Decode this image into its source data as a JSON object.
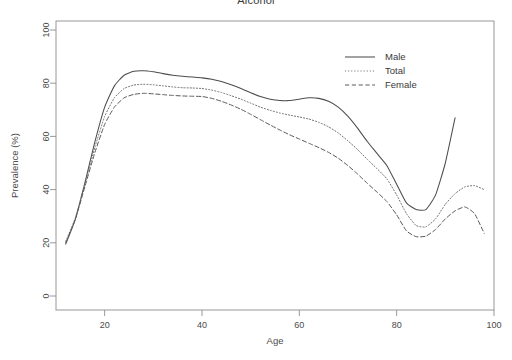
{
  "chart_data": {
    "type": "line",
    "title": "Alcohol",
    "xlabel": "Age",
    "ylabel": "Prevalence (%)",
    "xlim": [
      10,
      100
    ],
    "ylim": [
      0,
      100
    ],
    "xticks": [
      20,
      40,
      60,
      80,
      100
    ],
    "yticks": [
      0,
      20,
      40,
      60,
      80,
      100
    ],
    "grid": false,
    "legend_position": "top-right",
    "series": [
      {
        "name": "Male",
        "style": "solid",
        "color": "#4d4d4d",
        "x": [
          12,
          14,
          16,
          18,
          20,
          22,
          24,
          26,
          28,
          30,
          32,
          34,
          36,
          38,
          40,
          42,
          44,
          46,
          48,
          50,
          52,
          54,
          56,
          58,
          60,
          62,
          64,
          66,
          68,
          70,
          72,
          74,
          76,
          78,
          80,
          82,
          84,
          86,
          88,
          90,
          92
        ],
        "y": [
          19.5,
          29,
          43,
          58,
          71,
          79,
          83,
          84.5,
          84.7,
          84.3,
          83.6,
          83,
          82.6,
          82.3,
          82,
          81.5,
          80.6,
          79.4,
          78,
          76.4,
          75,
          74,
          73.5,
          73.5,
          74,
          74.5,
          74.3,
          73.2,
          71,
          67.5,
          63,
          58,
          53.5,
          49,
          42,
          35,
          32.5,
          32.5,
          38,
          50,
          67
        ]
      },
      {
        "name": "Total",
        "style": "dotted",
        "color": "#6e6e6e",
        "x": [
          12,
          14,
          16,
          18,
          20,
          22,
          24,
          26,
          28,
          30,
          32,
          34,
          36,
          38,
          40,
          42,
          44,
          46,
          48,
          50,
          52,
          54,
          56,
          58,
          60,
          62,
          64,
          66,
          68,
          70,
          72,
          74,
          76,
          78,
          80,
          82,
          84,
          86,
          88,
          90,
          92,
          94,
          96,
          98
        ],
        "y": [
          20.5,
          29.5,
          42.5,
          56,
          67.5,
          74.5,
          78,
          79.3,
          79.6,
          79.4,
          79,
          78.6,
          78.3,
          78.2,
          78,
          77.4,
          76.5,
          75.3,
          74,
          72.5,
          71,
          69.8,
          68.8,
          68,
          67.3,
          66.5,
          65.3,
          63.6,
          61.3,
          58.3,
          55,
          51.3,
          47.8,
          44,
          38,
          31,
          26.5,
          26,
          29,
          34.5,
          38.5,
          41,
          41.5,
          40
        ]
      },
      {
        "name": "Female",
        "style": "dashed",
        "color": "#5a5a5a",
        "x": [
          12,
          14,
          16,
          18,
          20,
          22,
          24,
          26,
          28,
          30,
          32,
          34,
          36,
          38,
          40,
          42,
          44,
          46,
          48,
          50,
          52,
          54,
          56,
          58,
          60,
          62,
          64,
          66,
          68,
          70,
          72,
          74,
          76,
          78,
          80,
          82,
          84,
          86,
          88,
          90,
          92,
          94,
          96,
          98
        ],
        "y": [
          20,
          29,
          41.5,
          54,
          64.5,
          71,
          74.5,
          75.8,
          76.2,
          76,
          75.7,
          75.4,
          75.2,
          75.1,
          75,
          74.3,
          73.2,
          71.8,
          70.2,
          68.3,
          66.3,
          64.3,
          62.4,
          60.6,
          59,
          57.4,
          55.8,
          54,
          51.8,
          49,
          45.8,
          42.3,
          39,
          35.5,
          30.5,
          24.5,
          22.3,
          22.5,
          25,
          29,
          32,
          33.5,
          31,
          23.5
        ]
      }
    ]
  }
}
